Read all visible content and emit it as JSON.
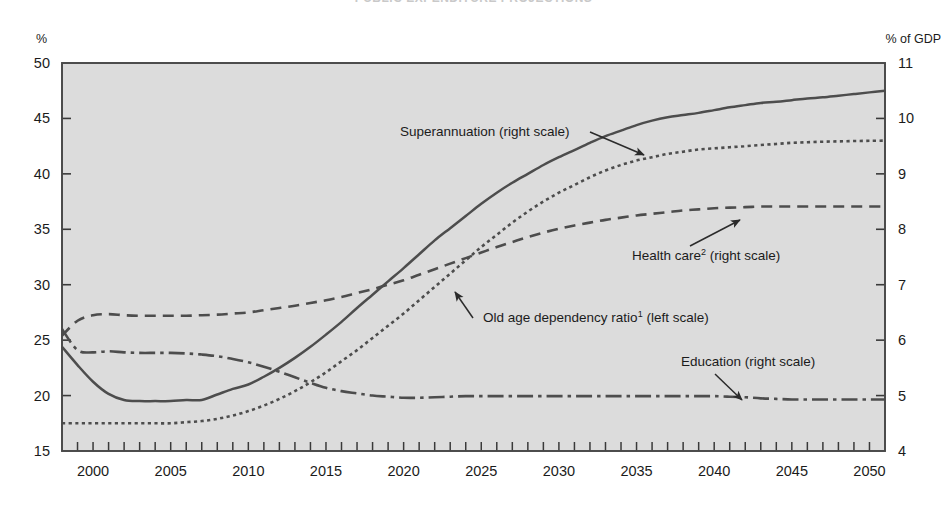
{
  "figure": {
    "title_partial": "PUBLIC EXPENDITURE PROJECTIONS",
    "left_axis_unit": "%",
    "right_axis_unit": "% of GDP"
  },
  "chart_data": {
    "type": "line",
    "title": "",
    "xlabel": "",
    "ylabel": "%",
    "y2label": "% of GDP",
    "xlim": [
      1998,
      2051
    ],
    "ylim": [
      15,
      50
    ],
    "y2lim": [
      4,
      11
    ],
    "grid": false,
    "legend": "annotations-on-plot",
    "x_ticks_major": [
      2000,
      2005,
      2010,
      2015,
      2020,
      2025,
      2030,
      2035,
      2040,
      2045,
      2050
    ],
    "x_ticks_minor_step": 1,
    "y_ticks_left": [
      15,
      20,
      25,
      30,
      35,
      40,
      45,
      50
    ],
    "y_ticks_right": [
      4,
      5,
      6,
      7,
      8,
      9,
      10,
      11
    ],
    "x": [
      1998,
      1999,
      2000,
      2001,
      2002,
      2003,
      2004,
      2005,
      2006,
      2007,
      2008,
      2009,
      2010,
      2011,
      2012,
      2013,
      2014,
      2015,
      2016,
      2017,
      2018,
      2019,
      2020,
      2021,
      2022,
      2023,
      2024,
      2025,
      2026,
      2027,
      2028,
      2029,
      2030,
      2031,
      2032,
      2033,
      2034,
      2035,
      2036,
      2037,
      2038,
      2039,
      2040,
      2041,
      2042,
      2043,
      2044,
      2045,
      2046,
      2047,
      2048,
      2049,
      2050,
      2051
    ],
    "series": [
      {
        "name": "Superannuation (right scale)",
        "axis": "right",
        "style": "solid",
        "color": "#4d4d4d",
        "values": [
          5.88,
          5.55,
          5.25,
          5.03,
          4.92,
          4.9,
          4.9,
          4.9,
          4.92,
          4.92,
          5.02,
          5.12,
          5.2,
          5.34,
          5.5,
          5.68,
          5.88,
          6.1,
          6.33,
          6.58,
          6.82,
          7.06,
          7.3,
          7.55,
          7.8,
          8.02,
          8.24,
          8.46,
          8.66,
          8.84,
          9.0,
          9.16,
          9.3,
          9.43,
          9.56,
          9.68,
          9.78,
          9.88,
          9.96,
          10.02,
          10.06,
          10.1,
          10.15,
          10.2,
          10.24,
          10.28,
          10.3,
          10.33,
          10.36,
          10.38,
          10.41,
          10.44,
          10.47,
          10.5
        ]
      },
      {
        "name": "Old age dependency ratio¹ (left scale)",
        "axis": "left",
        "style": "dotted",
        "color": "#4d4d4d",
        "values": [
          17.5,
          17.5,
          17.5,
          17.5,
          17.5,
          17.5,
          17.5,
          17.5,
          17.6,
          17.7,
          17.9,
          18.2,
          18.6,
          19.1,
          19.7,
          20.4,
          21.2,
          22.1,
          23.1,
          24.1,
          25.2,
          26.3,
          27.4,
          28.6,
          29.8,
          31.0,
          32.2,
          33.4,
          34.5,
          35.6,
          36.6,
          37.5,
          38.3,
          39.0,
          39.7,
          40.3,
          40.8,
          41.2,
          41.5,
          41.8,
          42.0,
          42.2,
          42.3,
          42.4,
          42.5,
          42.6,
          42.7,
          42.8,
          42.85,
          42.9,
          42.93,
          42.96,
          42.98,
          43.0
        ]
      },
      {
        "name": "Health care² (right scale)",
        "axis": "right",
        "style": "dashed",
        "color": "#4d4d4d",
        "values": [
          6.08,
          6.35,
          6.45,
          6.47,
          6.45,
          6.44,
          6.44,
          6.44,
          6.44,
          6.45,
          6.46,
          6.48,
          6.5,
          6.54,
          6.58,
          6.62,
          6.67,
          6.72,
          6.78,
          6.85,
          6.92,
          7.0,
          7.08,
          7.18,
          7.28,
          7.38,
          7.48,
          7.58,
          7.68,
          7.77,
          7.86,
          7.94,
          8.01,
          8.07,
          8.12,
          8.17,
          8.21,
          8.25,
          8.28,
          8.31,
          8.34,
          8.36,
          8.38,
          8.39,
          8.4,
          8.41,
          8.41,
          8.41,
          8.41,
          8.41,
          8.41,
          8.41,
          8.41,
          8.41
        ]
      },
      {
        "name": "Education (right scale)",
        "axis": "right",
        "style": "dashdot",
        "color": "#4d4d4d",
        "values": [
          6.2,
          5.82,
          5.78,
          5.8,
          5.78,
          5.77,
          5.77,
          5.77,
          5.76,
          5.74,
          5.71,
          5.66,
          5.6,
          5.52,
          5.43,
          5.33,
          5.23,
          5.14,
          5.08,
          5.04,
          5.0,
          4.98,
          4.96,
          4.96,
          4.97,
          4.98,
          4.99,
          4.99,
          4.99,
          4.99,
          4.99,
          4.99,
          4.99,
          4.99,
          4.99,
          4.99,
          4.99,
          4.99,
          4.99,
          4.99,
          4.99,
          4.99,
          4.99,
          4.98,
          4.97,
          4.95,
          4.94,
          4.93,
          4.93,
          4.93,
          4.93,
          4.93,
          4.93,
          4.93
        ]
      }
    ],
    "annotations": [
      {
        "name": "superannuation-label",
        "text": "Superannuation (right scale)",
        "x_text": 400,
        "y_text": 136,
        "arrow_to": [
          644,
          155
        ]
      },
      {
        "name": "health-care-label",
        "text": "Health care",
        "sup": "2",
        "suffix": " (right scale)",
        "x_text": 632,
        "y_text": 260,
        "arrow_to": [
          740,
          220
        ]
      },
      {
        "name": "old-age-label",
        "text": "Old age dependency ratio",
        "sup": "1",
        "suffix": " (left scale)",
        "x_text": 483,
        "y_text": 322,
        "arrow_to": [
          455,
          292
        ]
      },
      {
        "name": "education-label",
        "text": "Education (right scale)",
        "x_text": 681,
        "y_text": 366,
        "arrow_to": [
          742,
          400
        ]
      }
    ]
  }
}
